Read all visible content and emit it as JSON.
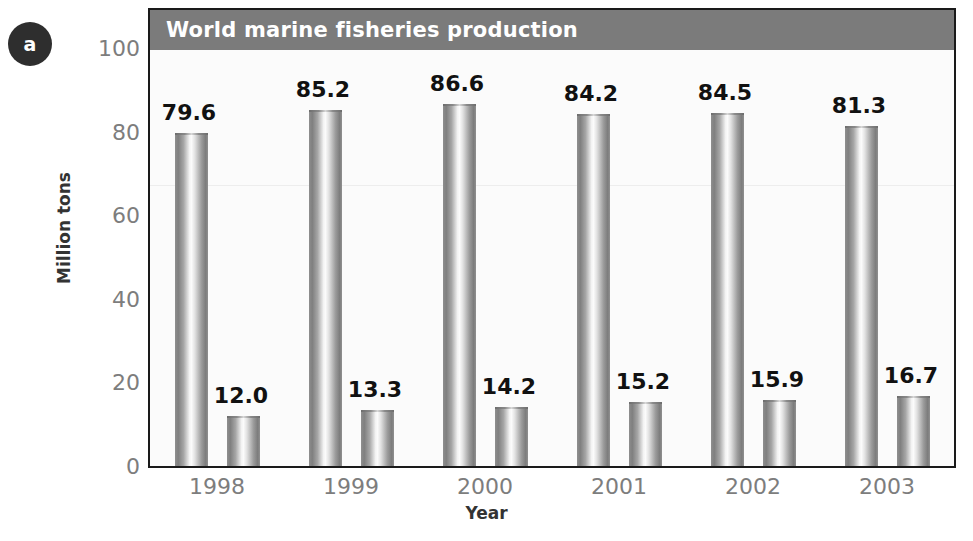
{
  "panel": {
    "badge_label": "a"
  },
  "chart_data": {
    "type": "bar",
    "title": "World marine fisheries production",
    "xlabel": "Year",
    "ylabel": "Million tons",
    "categories": [
      "1998",
      "1999",
      "2000",
      "2001",
      "2002",
      "2003"
    ],
    "series": [
      {
        "name": "capture",
        "values": [
          79.6,
          85.2,
          86.6,
          84.2,
          84.5,
          81.3
        ],
        "labels": [
          "79.6",
          "85.2",
          "86.6",
          "84.2",
          "84.5",
          "81.3"
        ]
      },
      {
        "name": "aquaculture",
        "values": [
          12.0,
          13.3,
          14.2,
          15.2,
          15.9,
          16.7
        ],
        "labels": [
          "12.0",
          "13.3",
          "14.2",
          "15.2",
          "15.9",
          "16.7"
        ]
      }
    ],
    "ylim": [
      0,
      100
    ],
    "yticks": [
      0,
      20,
      40,
      60,
      80,
      100
    ],
    "ytick_labels": [
      "0",
      "20",
      "40",
      "60",
      "80",
      "100"
    ],
    "grid": false,
    "legend": "none",
    "colors": {
      "title_bar": "#7b7b7b",
      "title_text": "#ffffff",
      "plot_background": "#fbfbfb",
      "axis_line": "#1a1a1a",
      "tick_text": "#7d7d7d",
      "axis_title_text": "#333333",
      "value_label_text": "#111111",
      "bar_edge": "#7f7f7f",
      "bar_highlight": "#fbfbfb",
      "badge_background": "#2e2e2e"
    }
  }
}
